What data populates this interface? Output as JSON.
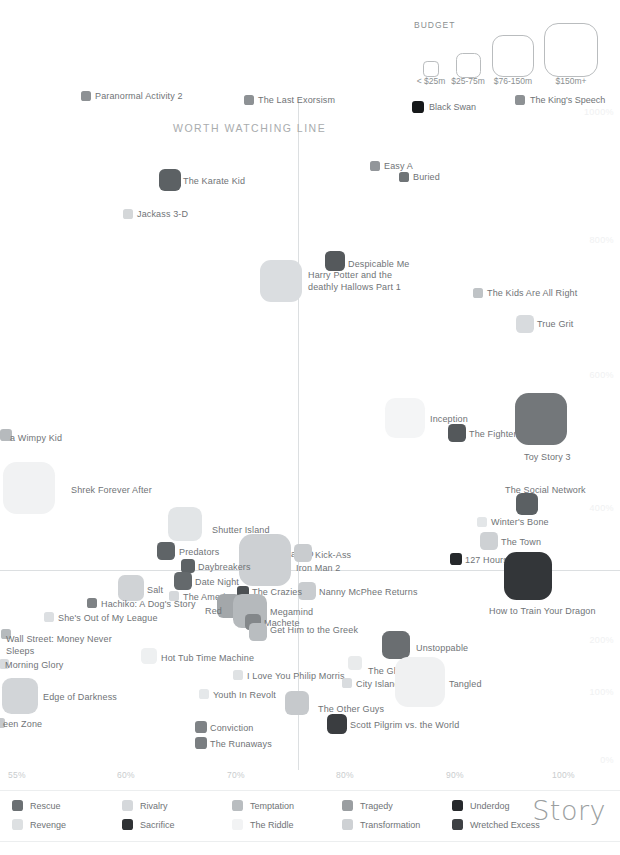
{
  "chart_data": {
    "type": "scatter",
    "title": "Story",
    "xlabel": "",
    "ylabel": "",
    "grid": false,
    "xlim": [
      55,
      103
    ],
    "ylim": [
      -20,
      1080
    ],
    "x_ticks": [
      {
        "label": "55%",
        "x": 8
      },
      {
        "label": "60%",
        "x": 117
      },
      {
        "label": "70%",
        "x": 227
      },
      {
        "label": "80%",
        "x": 336
      },
      {
        "label": "90%",
        "x": 446
      },
      {
        "label": "100%",
        "x": 552
      }
    ],
    "y_ticks": [
      {
        "label": "1000%",
        "y": 112
      },
      {
        "label": "800%",
        "y": 240
      },
      {
        "label": "600%",
        "y": 375
      },
      {
        "label": "400%",
        "y": 508
      },
      {
        "label": "200%",
        "y": 640
      },
      {
        "label": "100%",
        "y": 692
      },
      {
        "label": "0%",
        "y": 760
      }
    ],
    "reference_lines": {
      "vertical_label": "WORTH WATCHING LINE",
      "vertical_x": 298,
      "horizontal_y": 570
    },
    "legend_position": "bottom",
    "points": [
      {
        "name": "Paranormal Activity 2",
        "cx": 86,
        "cy": 96,
        "r": 5,
        "color": "#8d9194",
        "lx": 95,
        "ly": 91,
        "anchor": "left"
      },
      {
        "name": "The Last Exorsism",
        "cx": 249,
        "cy": 100,
        "r": 5,
        "color": "#8d9194",
        "lx": 258,
        "ly": 95,
        "anchor": "left"
      },
      {
        "name": "Easy A",
        "cx": 375,
        "cy": 166,
        "r": 5,
        "color": "#92969a",
        "lx": 384,
        "ly": 161,
        "anchor": "left"
      },
      {
        "name": "Buried",
        "cx": 404,
        "cy": 177,
        "r": 5,
        "color": "#6f7477",
        "lx": 413,
        "ly": 172,
        "anchor": "left"
      },
      {
        "name": "The Karate Kid",
        "cx": 170,
        "cy": 180,
        "r": 11,
        "color": "#5c6164",
        "lx": 183,
        "ly": 176,
        "anchor": "left"
      },
      {
        "name": "Jackass 3-D",
        "cx": 128,
        "cy": 214,
        "r": 5,
        "color": "#d4d7d9",
        "lx": 137,
        "ly": 209,
        "anchor": "left"
      },
      {
        "name": "Despicable Me",
        "cx": 335,
        "cy": 261,
        "r": 10,
        "color": "#55595c",
        "lx": 348,
        "ly": 259,
        "anchor": "left"
      },
      {
        "name": "Harry Potter and the deathly Hallows Part 1",
        "cx": 281,
        "cy": 281,
        "r": 21,
        "color": "#dadde0",
        "lx": 308,
        "ly": 270,
        "anchor": "left",
        "wrap": true
      },
      {
        "name": "The Kids Are All Right",
        "cx": 478,
        "cy": 293,
        "r": 5,
        "color": "#bfc3c6",
        "lx": 487,
        "ly": 288,
        "anchor": "left"
      },
      {
        "name": "True Grit",
        "cx": 525,
        "cy": 324,
        "r": 9,
        "color": "#d8dbde",
        "lx": 537,
        "ly": 319,
        "anchor": "left"
      },
      {
        "name": "Inception",
        "cx": 405,
        "cy": 418,
        "r": 20,
        "color": "#f4f5f6",
        "lx": 430,
        "ly": 414,
        "anchor": "left"
      },
      {
        "name": "The Fighter",
        "cx": 457,
        "cy": 433,
        "r": 9,
        "color": "#54585b",
        "lx": 469,
        "ly": 429,
        "anchor": "left"
      },
      {
        "name": "Toy Story 3",
        "cx": 541,
        "cy": 419,
        "r": 26,
        "color": "#73777a",
        "lx": 524,
        "ly": 452,
        "anchor": "left"
      },
      {
        "name": "Diary of a Wimpy Kid",
        "cx": 6,
        "cy": 435,
        "r": 6,
        "color": "#b6babd",
        "lx": 10,
        "ly": 433,
        "anchor": "left",
        "text": "a Wimpy Kid"
      },
      {
        "name": "Shrek Forever After",
        "cx": 29,
        "cy": 488,
        "r": 26,
        "color": "#f1f2f3",
        "lx": 71,
        "ly": 485,
        "anchor": "left"
      },
      {
        "name": "The Social Network",
        "cx": 527,
        "cy": 504,
        "r": 11,
        "color": "#5b6063",
        "lx": 505,
        "ly": 485,
        "anchor": "left"
      },
      {
        "name": "Winter's Bone",
        "cx": 482,
        "cy": 522,
        "r": 5,
        "color": "#e3e6e8",
        "lx": 491,
        "ly": 517,
        "anchor": "left"
      },
      {
        "name": "Shutter Island",
        "cx": 185,
        "cy": 524,
        "r": 17,
        "color": "#e2e5e7",
        "lx": 212,
        "ly": 525,
        "anchor": "left"
      },
      {
        "name": "The Town",
        "cx": 489,
        "cy": 541,
        "r": 9,
        "color": "#ced1d4",
        "lx": 501,
        "ly": 537,
        "anchor": "left"
      },
      {
        "name": "Predators",
        "cx": 166,
        "cy": 551,
        "r": 9,
        "color": "#5f6467",
        "lx": 179,
        "ly": 547,
        "anchor": "left"
      },
      {
        "name": "Piranha 3-D",
        "cx": 253,
        "cy": 553,
        "r": 7,
        "color": "#2e3134",
        "lx": 264,
        "ly": 549,
        "anchor": "left"
      },
      {
        "name": "Kick-Ass",
        "cx": 303,
        "cy": 553,
        "r": 9,
        "color": "#c9cccf",
        "lx": 315,
        "ly": 550,
        "anchor": "left"
      },
      {
        "name": "Nanny McPhee Returns",
        "cx": 307,
        "cy": 591,
        "r": 9,
        "color": "#c9cccf",
        "lx": 319,
        "ly": 587,
        "anchor": "left"
      },
      {
        "name": "127 Hours",
        "cx": 456,
        "cy": 559,
        "r": 6,
        "color": "#25282b",
        "lx": 465,
        "ly": 555,
        "anchor": "left"
      },
      {
        "name": "Iron Man 2",
        "cx": 265,
        "cy": 560,
        "r": 26,
        "color": "#cdd0d3",
        "lx": 296,
        "ly": 563,
        "anchor": "left"
      },
      {
        "name": "Daybreakers",
        "cx": 188,
        "cy": 566,
        "r": 7,
        "color": "#5d6265",
        "lx": 198,
        "ly": 562,
        "anchor": "left"
      },
      {
        "name": "Date Night",
        "cx": 183,
        "cy": 581,
        "r": 9,
        "color": "#64696c",
        "lx": 195,
        "ly": 577,
        "anchor": "left"
      },
      {
        "name": "Salt",
        "cx": 131,
        "cy": 588,
        "r": 13,
        "color": "#d0d3d6",
        "lx": 147,
        "ly": 585,
        "anchor": "left"
      },
      {
        "name": "How to Train Your Dragon",
        "cx": 528,
        "cy": 576,
        "r": 24,
        "color": "#333639",
        "lx": 489,
        "ly": 606,
        "anchor": "left"
      },
      {
        "name": "The Crazies",
        "cx": 243,
        "cy": 592,
        "r": 6,
        "color": "#4c5053",
        "lx": 252,
        "ly": 587,
        "anchor": "left"
      },
      {
        "name": "The American",
        "cx": 174,
        "cy": 596,
        "r": 5,
        "color": "#d5d8db",
        "lx": 183,
        "ly": 592,
        "anchor": "left"
      },
      {
        "name": "Hachiko: A Dog's Story",
        "cx": 92,
        "cy": 603,
        "r": 5,
        "color": "#7e8285",
        "lx": 101,
        "ly": 599,
        "anchor": "left"
      },
      {
        "name": "Red",
        "cx": 229,
        "cy": 606,
        "r": 12,
        "color": "#a3a7aa",
        "lx": 205,
        "ly": 606,
        "anchor": "left"
      },
      {
        "name": "Megamind",
        "cx": 250,
        "cy": 611,
        "r": 17,
        "color": "#b5b9bc",
        "lx": 270,
        "ly": 607,
        "anchor": "left"
      },
      {
        "name": "She's Out of My League",
        "cx": 49,
        "cy": 617,
        "r": 5,
        "color": "#dcdfe2",
        "lx": 58,
        "ly": 613,
        "anchor": "left"
      },
      {
        "name": "Machete",
        "cx": 253,
        "cy": 622,
        "r": 8,
        "color": "#83878a",
        "lx": 264,
        "ly": 618,
        "anchor": "left"
      },
      {
        "name": "Get Him to the Greek",
        "cx": 258,
        "cy": 632,
        "r": 9,
        "color": "#b9bdc0",
        "lx": 270,
        "ly": 625,
        "anchor": "left"
      },
      {
        "name": "Wall Street: Money Never Sleeps",
        "cx": 6,
        "cy": 634,
        "r": 5,
        "color": "#b6babd",
        "lx": 6,
        "ly": 634,
        "anchor": "left",
        "wrap": true
      },
      {
        "name": "Unstoppable",
        "cx": 396,
        "cy": 645,
        "r": 14,
        "color": "#6a6e71",
        "lx": 416,
        "ly": 643,
        "anchor": "left"
      },
      {
        "name": "Hot Tub Time Machine",
        "cx": 149,
        "cy": 656,
        "r": 8,
        "color": "#eef0f1",
        "lx": 161,
        "ly": 653,
        "anchor": "left"
      },
      {
        "name": "Morning Glory",
        "cx": 4,
        "cy": 664,
        "r": 5,
        "color": "#d8dbde",
        "lx": 5,
        "ly": 660,
        "anchor": "left"
      },
      {
        "name": "The Ghost Writer",
        "cx": 355,
        "cy": 663,
        "r": 7,
        "color": "#e9ebec",
        "lx": 368,
        "ly": 666,
        "anchor": "left"
      },
      {
        "name": "I Love You Philip Morris",
        "cx": 238,
        "cy": 675,
        "r": 5,
        "color": "#dfe2e4",
        "lx": 247,
        "ly": 671,
        "anchor": "left"
      },
      {
        "name": "City Island",
        "cx": 347,
        "cy": 683,
        "r": 5,
        "color": "#d9dcdf",
        "lx": 356,
        "ly": 679,
        "anchor": "left"
      },
      {
        "name": "Tangled",
        "cx": 420,
        "cy": 682,
        "r": 25,
        "color": "#f0f1f2",
        "lx": 449,
        "ly": 679,
        "anchor": "left"
      },
      {
        "name": "Edge of Darkness",
        "cx": 20,
        "cy": 696,
        "r": 18,
        "color": "#d2d5d8",
        "lx": 43,
        "ly": 692,
        "anchor": "left"
      },
      {
        "name": "Youth In Revolt",
        "cx": 204,
        "cy": 694,
        "r": 5,
        "color": "#e5e8ea",
        "lx": 213,
        "ly": 690,
        "anchor": "left"
      },
      {
        "name": "The Other Guys",
        "cx": 297,
        "cy": 703,
        "r": 12,
        "color": "#c6c9cc",
        "lx": 318,
        "ly": 704,
        "anchor": "left"
      },
      {
        "name": "Green Zone",
        "cx": 0,
        "cy": 723,
        "r": 5,
        "color": "#c6c9cc",
        "lx": 3,
        "ly": 719,
        "anchor": "left",
        "text": "een Zone"
      },
      {
        "name": "Scott Pilgrim vs. the World",
        "cx": 337,
        "cy": 724,
        "r": 10,
        "color": "#3a3d40",
        "lx": 350,
        "ly": 720,
        "anchor": "left"
      },
      {
        "name": "Conviction",
        "cx": 201,
        "cy": 727,
        "r": 6,
        "color": "#7f8386",
        "lx": 210,
        "ly": 723,
        "anchor": "left"
      },
      {
        "name": "The Runaways",
        "cx": 201,
        "cy": 743,
        "r": 6,
        "color": "#7a7e81",
        "lx": 210,
        "ly": 739,
        "anchor": "left"
      }
    ]
  },
  "budget_legend": {
    "title": "BUDGET",
    "sizes": [
      {
        "label": "< $25m",
        "d": 14,
        "cx": 430,
        "cy": 68
      },
      {
        "label": "$25-75m",
        "d": 23,
        "cx": 467,
        "cy": 64
      },
      {
        "label": "$76-150m",
        "d": 40,
        "cx": 512,
        "cy": 55
      },
      {
        "label": "$150m+",
        "d": 52,
        "cx": 570,
        "cy": 49
      }
    ],
    "examples": [
      {
        "label": "Black Swan",
        "color": "#16181a",
        "cx": 418,
        "cy": 107,
        "r": 6
      },
      {
        "label": "The King's Speech",
        "color": "#8d9194",
        "cx": 520,
        "cy": 100,
        "r": 5
      }
    ]
  },
  "story_legend": {
    "title": "Story",
    "items": [
      {
        "label": "Rescue",
        "color": "#6b7073",
        "col": 0,
        "row": 0
      },
      {
        "label": "Revenge",
        "color": "#dde0e2",
        "col": 0,
        "row": 1
      },
      {
        "label": "Rivalry",
        "color": "#d5d8db",
        "col": 1,
        "row": 0
      },
      {
        "label": "Sacrifice",
        "color": "#2f3235",
        "col": 1,
        "row": 1
      },
      {
        "label": "Temptation",
        "color": "#b9bdc0",
        "col": 2,
        "row": 0
      },
      {
        "label": "The Riddle",
        "color": "#f2f3f4",
        "col": 2,
        "row": 1
      },
      {
        "label": "Tragedy",
        "color": "#9a9ea1",
        "col": 3,
        "row": 0
      },
      {
        "label": "Transformation",
        "color": "#ced1d4",
        "col": 3,
        "row": 1
      },
      {
        "label": "Underdog",
        "color": "#26292c",
        "col": 4,
        "row": 0
      },
      {
        "label": "Wretched Excess",
        "color": "#3e4144",
        "col": 4,
        "row": 1
      }
    ]
  }
}
